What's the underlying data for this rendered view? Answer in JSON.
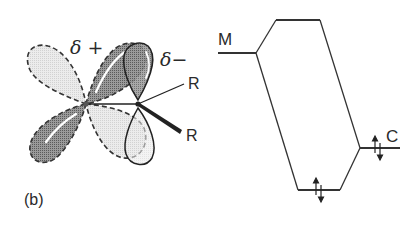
{
  "panel_label": "(b)",
  "orbital_diagram": {
    "delta_plus_label": "δ +",
    "delta_minus_label": "δ−",
    "substituent_upper": "R",
    "substituent_lower": "R",
    "colors": {
      "dark_lobe": "#8a8a8a",
      "light_lobe": "#e4e4e4",
      "line": "#333333"
    }
  },
  "energy_diagram": {
    "left_level_label": "M",
    "right_level_label": "C",
    "electrons": [
      {
        "level": "carbon",
        "arrows": "↑↓"
      },
      {
        "level": "bonding",
        "arrows": "↑↓"
      }
    ]
  }
}
